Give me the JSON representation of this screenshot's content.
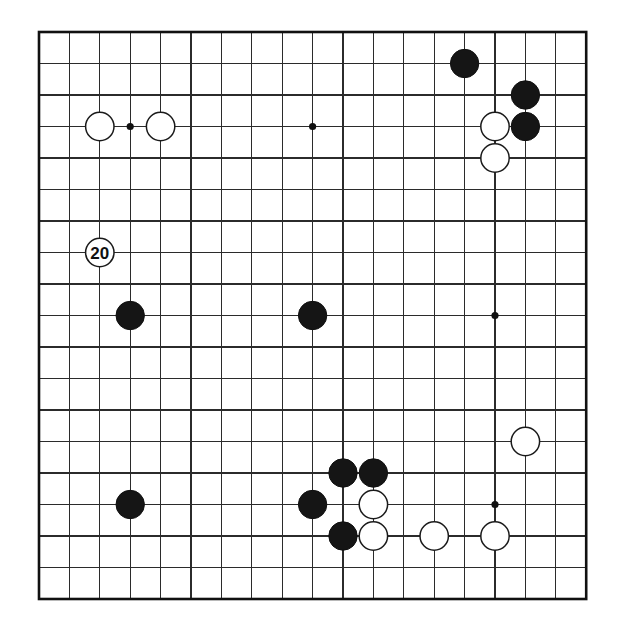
{
  "diagram": {
    "kind": "go-board-diagram",
    "board_size": 19,
    "title": "",
    "caption": "",
    "colors": {
      "background": "#ffffff",
      "grid": "#2b2b2b",
      "border": "#111111",
      "black_stone": "#151515",
      "white_stone": "#ffffff",
      "star_point": "#111111"
    },
    "geometry": {
      "left": 39,
      "top": 32,
      "right": 586,
      "bottom": 599,
      "step_x": 30.4,
      "step_y": 31.5,
      "stone_radius": 14.2
    },
    "star_points": [
      {
        "col": 3,
        "row": 3
      },
      {
        "col": 9,
        "row": 3
      },
      {
        "col": 15,
        "row": 3
      },
      {
        "col": 3,
        "row": 9
      },
      {
        "col": 9,
        "row": 9
      },
      {
        "col": 15,
        "row": 9
      },
      {
        "col": 3,
        "row": 15
      },
      {
        "col": 9,
        "row": 15
      },
      {
        "col": 15,
        "row": 15
      }
    ],
    "stones": [
      {
        "color": "black",
        "col": 14,
        "row": 1,
        "label": ""
      },
      {
        "color": "black",
        "col": 16,
        "row": 2,
        "label": ""
      },
      {
        "color": "white",
        "col": 15,
        "row": 3,
        "label": ""
      },
      {
        "color": "black",
        "col": 16,
        "row": 3,
        "label": ""
      },
      {
        "color": "white",
        "col": 15,
        "row": 4,
        "label": ""
      },
      {
        "color": "white",
        "col": 2,
        "row": 3,
        "label": ""
      },
      {
        "color": "white",
        "col": 4,
        "row": 3,
        "label": ""
      },
      {
        "color": "white",
        "col": 2,
        "row": 7,
        "label": "20"
      },
      {
        "color": "black",
        "col": 3,
        "row": 9,
        "label": ""
      },
      {
        "color": "black",
        "col": 9,
        "row": 9,
        "label": ""
      },
      {
        "color": "white",
        "col": 16,
        "row": 13,
        "label": ""
      },
      {
        "color": "black",
        "col": 10,
        "row": 14,
        "label": ""
      },
      {
        "color": "black",
        "col": 11,
        "row": 14,
        "label": ""
      },
      {
        "color": "black",
        "col": 9,
        "row": 15,
        "label": ""
      },
      {
        "color": "white",
        "col": 11,
        "row": 15,
        "label": ""
      },
      {
        "color": "black",
        "col": 3,
        "row": 15,
        "label": ""
      },
      {
        "color": "black",
        "col": 10,
        "row": 16,
        "label": ""
      },
      {
        "color": "white",
        "col": 11,
        "row": 16,
        "label": ""
      },
      {
        "color": "white",
        "col": 13,
        "row": 16,
        "label": ""
      },
      {
        "color": "white",
        "col": 15,
        "row": 16,
        "label": ""
      }
    ]
  }
}
